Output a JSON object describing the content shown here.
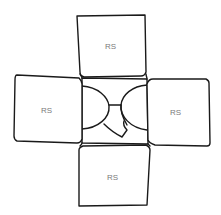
{
  "diagram": {
    "type": "cross-layout sketch",
    "center": {
      "label": ""
    },
    "boxes": [
      {
        "position": "top",
        "label": "RS"
      },
      {
        "position": "left",
        "label": "RS"
      },
      {
        "position": "right",
        "label": "RS"
      },
      {
        "position": "bottom",
        "label": "RS"
      }
    ]
  },
  "colors": {
    "stroke": "#1a1a1a",
    "label": "#7a7a7a",
    "background": "#ffffff"
  }
}
